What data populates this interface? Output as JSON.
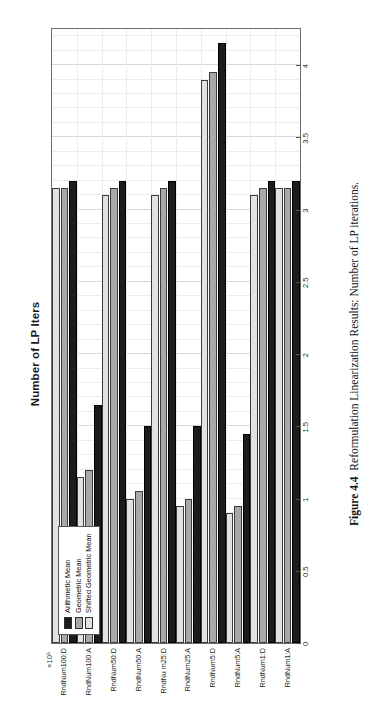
{
  "figure": {
    "caption_label": "Figure 4.4",
    "caption_text": "Reformulation Linearization Results: Number of LP iterations."
  },
  "chart_data": {
    "type": "bar",
    "orientation": "horizontal",
    "title": "Number of LP Iters",
    "xlabel": "",
    "ylabel": "",
    "multiplier": "×10⁶",
    "grid": true,
    "legend_position": "top-left",
    "axis_range": [
      0,
      4.25
    ],
    "tick_labels": [
      "0",
      "0.5",
      "1",
      "1.5",
      "2",
      "2.5",
      "3",
      "3.5",
      "4"
    ],
    "tick_values": [
      0,
      0.5,
      1,
      1.5,
      2,
      2.5,
      3,
      3.5,
      4
    ],
    "categories": [
      "RndNum1:A",
      "RndNum1:D",
      "RndNum5:A",
      "RndNum5:D",
      "RndNum25:A",
      "RndNu m25:D",
      "RndNum50:A",
      "RndNum50:D",
      "RndNum100:A",
      "RndNum100:D"
    ],
    "series": [
      {
        "name": "Arithmetic Mean",
        "color": "#1c1c1c",
        "values": [
          3.2,
          3.2,
          1.45,
          4.15,
          1.5,
          3.2,
          1.5,
          3.2,
          1.65,
          3.2
        ]
      },
      {
        "name": "Geometric Mean",
        "color": "#a8a8a8",
        "values": [
          3.15,
          3.15,
          0.95,
          3.95,
          1.0,
          3.15,
          1.05,
          3.15,
          1.2,
          3.15
        ]
      },
      {
        "name": "Shifted Geometric Mean",
        "color": "#e2e2e2",
        "values": [
          3.15,
          3.1,
          0.9,
          3.9,
          0.95,
          3.1,
          1.0,
          3.1,
          1.15,
          3.15
        ]
      }
    ]
  }
}
